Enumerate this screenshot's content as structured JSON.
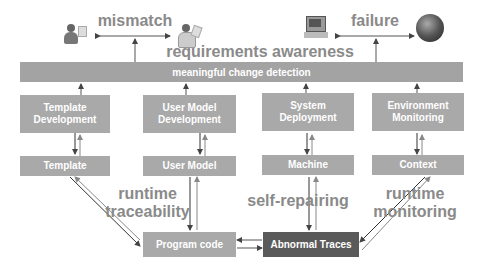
{
  "header": {
    "title": "requirements awareness",
    "bar_label": "meaningful change detection"
  },
  "top_relations": [
    {
      "label": "mismatch",
      "left_icon": "user-with-document-icon",
      "right_icon": "user-with-clipboard-icon"
    },
    {
      "label": "failure",
      "left_icon": "computer-icon",
      "right_icon": "globe-icon"
    }
  ],
  "columns": [
    {
      "development": "Template Development",
      "artifact": "Template"
    },
    {
      "development": "User Model Development",
      "artifact": "User Model"
    },
    {
      "development": "System Deployment",
      "artifact": "Machine"
    },
    {
      "development": "Environment Monitoring",
      "artifact": "Context"
    }
  ],
  "bottom": {
    "program_code": "Program code",
    "abnormal_traces": "Abnormal Traces"
  },
  "annotations": {
    "runtime_traceability": "runtime traceability",
    "self_repairing": "self-repairing",
    "runtime_monitoring": "runtime monitoring"
  },
  "colors": {
    "box": "#a9a9a9",
    "dark_box": "#5a5a5a",
    "bar": "#a3a3a3",
    "label_text": "#8a8a8a",
    "arrow": "#444444"
  }
}
